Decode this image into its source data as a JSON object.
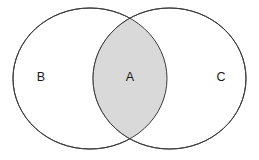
{
  "figure": {
    "type": "venn-diagram",
    "width": 259,
    "height": 160,
    "background_color": "#ffffff"
  },
  "style": {
    "stroke_color": "#3a3a3a",
    "stroke_width": 1,
    "circle_fill": "#ffffff",
    "intersection_fill": "#d9d9d9",
    "label_color": "#1a1a1a"
  },
  "sets": [
    {
      "id": "left",
      "label": "B",
      "label_x": 41,
      "label_y": 78,
      "cx": 90,
      "cy": 78.5,
      "rx": 77,
      "ry": 70.5,
      "shaded": false
    },
    {
      "id": "right",
      "label": "C",
      "label_x": 221,
      "label_y": 78,
      "cx": 169.5,
      "cy": 78.5,
      "rx": 76.5,
      "ry": 70.5,
      "shaded": false
    }
  ],
  "intersection": {
    "id": "lens",
    "label": "A",
    "label_x": 130,
    "label_y": 78,
    "shaded": true,
    "fill": "#d9d9d9"
  },
  "chart_data": {
    "type": "venn",
    "title": "",
    "regions": [
      {
        "name": "B",
        "sets": [
          "B"
        ],
        "shaded": false,
        "fill": "#ffffff"
      },
      {
        "name": "A",
        "sets": [
          "B",
          "C"
        ],
        "shaded": true,
        "fill": "#d9d9d9"
      },
      {
        "name": "C",
        "sets": [
          "C"
        ],
        "shaded": false,
        "fill": "#ffffff"
      }
    ],
    "set_labels": [
      "B",
      "C"
    ],
    "intersection_label": "A",
    "legend": "none",
    "grid": false
  }
}
